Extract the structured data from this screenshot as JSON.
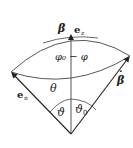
{
  "diagram": {
    "labels": {
      "beta_top": "β",
      "e_z": "e",
      "e_z_sub": "z",
      "phi_diff": "φ₀ − φ",
      "theta_arc": "θ",
      "e_n": "e",
      "e_n_sub": "n",
      "vartheta": "ϑ",
      "vartheta0": "ϑ",
      "vartheta0_sub": "0",
      "beta_dot": "β",
      "beta_dot_mark": "·"
    },
    "colors": {
      "line": "#2b2b2b",
      "vertical_axis": "#555555",
      "background": "#ffffff"
    }
  }
}
